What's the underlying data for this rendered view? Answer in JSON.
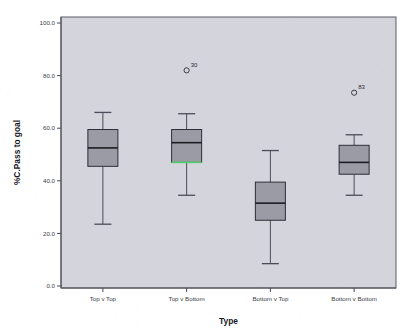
{
  "chart_data": {
    "type": "box",
    "title": "",
    "xlabel": "Type",
    "ylabel": "%C.Pass to goal",
    "categories": [
      "Top v Top",
      "Top v Bottom",
      "Bottom v Top",
      "Bottom v Bottom"
    ],
    "ylim": [
      0.0,
      100.0
    ],
    "y_ticks": [
      "0.0",
      "20.0",
      "40.0",
      "60.0",
      "80.0",
      "100.0"
    ],
    "y_tick_values": [
      0.0,
      20.0,
      40.0,
      60.0,
      80.0,
      100.0
    ],
    "grid": false,
    "legend": "none",
    "background": "#d3d4dc",
    "box_fill": "#9b9ba6",
    "accent_green": "#4fd06a",
    "boxes": [
      {
        "category": "Top v Top",
        "whisker_low": 23.5,
        "q1": 45.5,
        "median": 52.5,
        "q3": 59.5,
        "whisker_high": 66.0,
        "accent_color": "",
        "outliers": []
      },
      {
        "category": "Top v Bottom",
        "whisker_low": 34.5,
        "q1": 47.0,
        "median": 54.5,
        "q3": 59.5,
        "whisker_high": 65.5,
        "accent_color": "#4fd06a",
        "outliers": [
          {
            "value": 82.0,
            "label": "30"
          }
        ]
      },
      {
        "category": "Bottom v Top",
        "whisker_low": 8.5,
        "q1": 25.0,
        "median": 31.5,
        "q3": 39.5,
        "whisker_high": 51.5,
        "accent_color": "",
        "outliers": []
      },
      {
        "category": "Bottom v Bottom",
        "whisker_low": 34.5,
        "q1": 42.5,
        "median": 47.0,
        "q3": 53.5,
        "whisker_high": 57.5,
        "accent_color": "",
        "outliers": [
          {
            "value": 73.5,
            "label": "83"
          }
        ]
      }
    ]
  }
}
